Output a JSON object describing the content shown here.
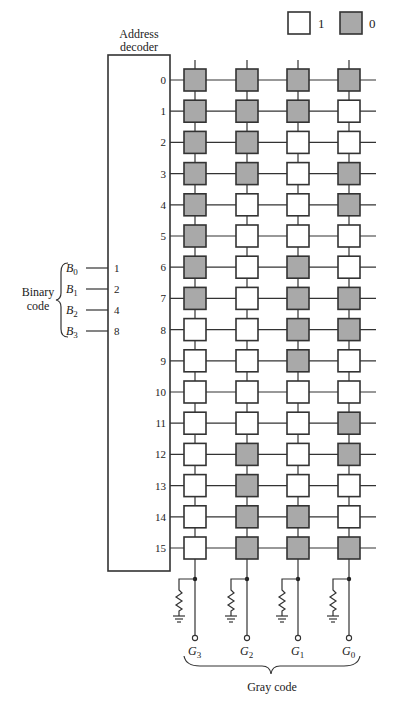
{
  "legend": {
    "items": [
      {
        "label": "1",
        "fill": "#ffffff"
      },
      {
        "label": "0",
        "fill": "#a9a9a9"
      }
    ]
  },
  "decoder": {
    "title_line1": "Address",
    "title_line2": "decoder",
    "output_labels": [
      "0",
      "1",
      "2",
      "3",
      "4",
      "5",
      "6",
      "7",
      "8",
      "9",
      "10",
      "11",
      "12",
      "13",
      "14",
      "15"
    ],
    "input_weights": [
      "1",
      "2",
      "4",
      "8"
    ]
  },
  "inputs": {
    "group_label_line1": "Binary",
    "group_label_line2": "code",
    "signals": [
      {
        "name": "B",
        "sub": "0"
      },
      {
        "name": "B",
        "sub": "1"
      },
      {
        "name": "B",
        "sub": "2"
      },
      {
        "name": "B",
        "sub": "3"
      }
    ]
  },
  "outputs": {
    "group_label": "Gray code",
    "signals": [
      {
        "name": "G",
        "sub": "3"
      },
      {
        "name": "G",
        "sub": "2"
      },
      {
        "name": "G",
        "sub": "1"
      },
      {
        "name": "G",
        "sub": "0"
      }
    ]
  },
  "colors": {
    "cell_one": "#ffffff",
    "cell_zero": "#a9a9a9",
    "line": "#333333"
  },
  "matrix": {
    "columns": [
      "G3",
      "G2",
      "G1",
      "G0"
    ],
    "rows": [
      [
        0,
        0,
        0,
        0
      ],
      [
        0,
        0,
        0,
        1
      ],
      [
        0,
        0,
        1,
        1
      ],
      [
        0,
        0,
        1,
        0
      ],
      [
        0,
        1,
        1,
        0
      ],
      [
        0,
        1,
        1,
        1
      ],
      [
        0,
        1,
        0,
        1
      ],
      [
        0,
        1,
        0,
        0
      ],
      [
        1,
        1,
        0,
        0
      ],
      [
        1,
        1,
        0,
        1
      ],
      [
        1,
        1,
        1,
        1
      ],
      [
        1,
        1,
        1,
        0
      ],
      [
        1,
        0,
        1,
        0
      ],
      [
        1,
        0,
        1,
        1
      ],
      [
        1,
        0,
        0,
        1
      ],
      [
        1,
        0,
        0,
        0
      ]
    ]
  }
}
